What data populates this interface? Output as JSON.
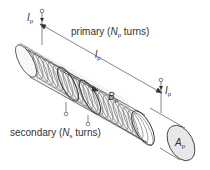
{
  "diagram": {
    "labels": {
      "primary_prefix": "primary (",
      "primary_var": "N",
      "primary_sub": "p",
      "primary_suffix": " turns)",
      "secondary_prefix": "secondary (",
      "secondary_var": "N",
      "secondary_sub": "s",
      "secondary_suffix": " turns)",
      "current_var": "I",
      "current_sub": "p",
      "length_var": "l",
      "length_sub": "p",
      "field_var": "B",
      "field_sub": "p",
      "area_var": "A",
      "area_sub": "p"
    },
    "colors": {
      "stroke": "#333333",
      "coil_fill": "#f2f2f2",
      "end_face_fill": "#e6e6e6",
      "text": "#333333"
    }
  }
}
